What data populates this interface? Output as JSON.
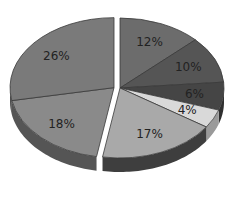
{
  "chart_data": {
    "type": "pie",
    "style": "3d-exploded",
    "title": "",
    "unit": "%",
    "categories": [
      "A",
      "B",
      "C",
      "D",
      "E",
      "F",
      "G"
    ],
    "values": [
      12,
      10,
      6,
      4,
      17,
      18,
      26
    ],
    "labels": [
      "12%",
      "10%",
      "6%",
      "4%",
      "17%",
      "18%",
      "26%"
    ],
    "colors": [
      "#6c6c6c",
      "#555555",
      "#454545",
      "#d9d9d9",
      "#a9a9a9",
      "#8a8a8a",
      "#7a7a7a"
    ],
    "side_colors": [
      "#4a4a4a",
      "#3a3a3a",
      "#2f2f2f",
      "#9a9a9a",
      "#3e3e3e",
      "#555555",
      "#4a4a4a"
    ],
    "exploded_group": [
      5,
      6
    ],
    "start_angle_deg": -90,
    "direction": "clockwise",
    "legend": "none"
  },
  "background": "#ffffff"
}
